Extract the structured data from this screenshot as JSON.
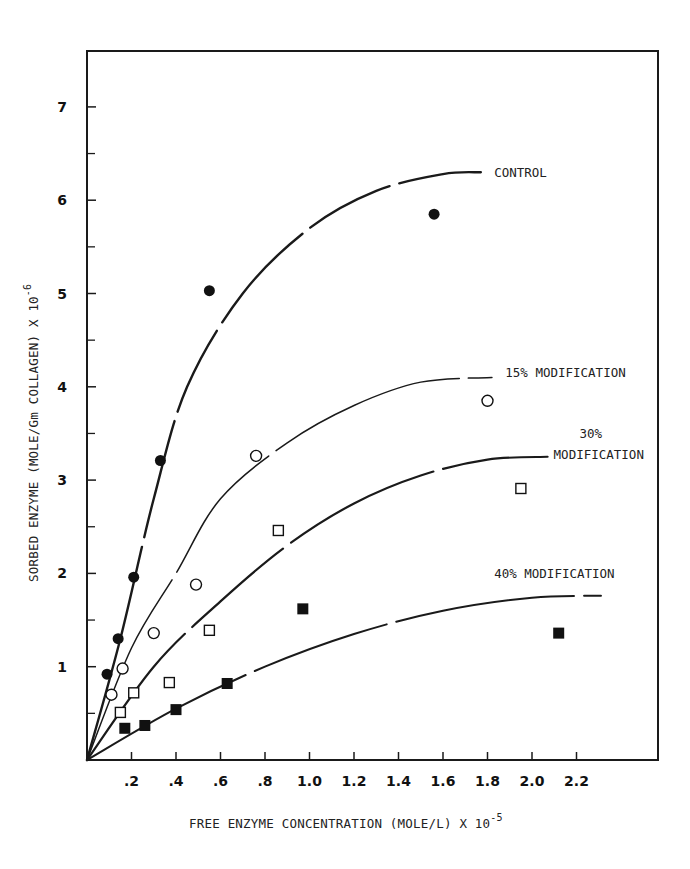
{
  "chart_data": {
    "type": "scatter",
    "title": "",
    "xlabel": "FREE ENZYME CONCENTRATION (MOLE/L) X 10",
    "xlabel_exponent": "-5",
    "ylabel": "SORBED ENZYME (MOLE/Gm COLLAGEN) X 10",
    "ylabel_exponent": "-6",
    "xlim": [
      0,
      2.55
    ],
    "ylim": [
      0,
      7.5
    ],
    "x_ticks": [
      0.2,
      0.4,
      0.6,
      0.8,
      1.0,
      1.2,
      1.4,
      1.6,
      1.8,
      2.0,
      2.2
    ],
    "x_tick_labels": [
      ".2",
      ".4",
      ".6",
      ".8",
      "1.0",
      "1.2",
      "1.4",
      "1.6",
      "1.8",
      "2.0",
      "2.2"
    ],
    "y_ticks": [
      1,
      2,
      3,
      4,
      5,
      6,
      7
    ],
    "y_tick_labels": [
      "1",
      "2",
      "3",
      "4",
      "5",
      "6",
      "7"
    ],
    "y_minor_ticks": [
      0.5,
      1.5,
      2.5,
      3.5,
      4.5,
      5.5,
      6.5
    ],
    "grid": false,
    "legend_position": "inline labels at curve ends",
    "series": [
      {
        "name": "CONTROL",
        "marker": "filled-circle",
        "points": [
          [
            0.09,
            0.92
          ],
          [
            0.14,
            1.3
          ],
          [
            0.21,
            1.96
          ],
          [
            0.33,
            3.21
          ],
          [
            0.55,
            5.03
          ],
          [
            1.56,
            5.85
          ]
        ],
        "fit_curve": [
          [
            0,
            0
          ],
          [
            0.15,
            1.3
          ],
          [
            0.3,
            2.8
          ],
          [
            0.45,
            4.0
          ],
          [
            0.7,
            5.0
          ],
          [
            1.0,
            5.7
          ],
          [
            1.3,
            6.1
          ],
          [
            1.6,
            6.28
          ],
          [
            1.77,
            6.3
          ]
        ],
        "label": "CONTROL",
        "label_pos": [
          1.83,
          6.25
        ]
      },
      {
        "name": "15% MODIFICATION",
        "marker": "open-circle",
        "points": [
          [
            0.11,
            0.7
          ],
          [
            0.16,
            0.98
          ],
          [
            0.3,
            1.36
          ],
          [
            0.49,
            1.88
          ],
          [
            0.76,
            3.26
          ],
          [
            1.8,
            3.85
          ]
        ],
        "fit_curve": [
          [
            0,
            0
          ],
          [
            0.2,
            1.2
          ],
          [
            0.4,
            2.0
          ],
          [
            0.6,
            2.8
          ],
          [
            0.9,
            3.4
          ],
          [
            1.2,
            3.8
          ],
          [
            1.5,
            4.05
          ],
          [
            1.82,
            4.1
          ]
        ],
        "label": "15% MODIFICATION",
        "label_pos": [
          1.88,
          4.1
        ]
      },
      {
        "name": "30% MODIFICATION",
        "marker": "open-square",
        "points": [
          [
            0.15,
            0.51
          ],
          [
            0.21,
            0.72
          ],
          [
            0.37,
            0.83
          ],
          [
            0.55,
            1.39
          ],
          [
            0.86,
            2.46
          ],
          [
            1.95,
            2.91
          ]
        ],
        "fit_curve": [
          [
            0,
            0
          ],
          [
            0.3,
            1.0
          ],
          [
            0.6,
            1.7
          ],
          [
            0.9,
            2.3
          ],
          [
            1.2,
            2.75
          ],
          [
            1.5,
            3.05
          ],
          [
            1.8,
            3.22
          ],
          [
            2.07,
            3.25
          ]
        ],
        "label_line1": "30%",
        "label_line2": "MODIFICATION",
        "label_pos": [
          2.3,
          3.4
        ]
      },
      {
        "name": "40% MODIFICATION",
        "marker": "filled-square",
        "points": [
          [
            0.17,
            0.34
          ],
          [
            0.26,
            0.37
          ],
          [
            0.4,
            0.54
          ],
          [
            0.63,
            0.82
          ],
          [
            0.97,
            1.62
          ],
          [
            2.12,
            1.36
          ]
        ],
        "fit_curve": [
          [
            0,
            0
          ],
          [
            0.4,
            0.55
          ],
          [
            0.8,
            1.0
          ],
          [
            1.2,
            1.35
          ],
          [
            1.6,
            1.6
          ],
          [
            2.0,
            1.74
          ],
          [
            2.31,
            1.76
          ]
        ],
        "label": "40% MODIFICATION",
        "label_pos": [
          1.83,
          1.95
        ]
      }
    ]
  }
}
